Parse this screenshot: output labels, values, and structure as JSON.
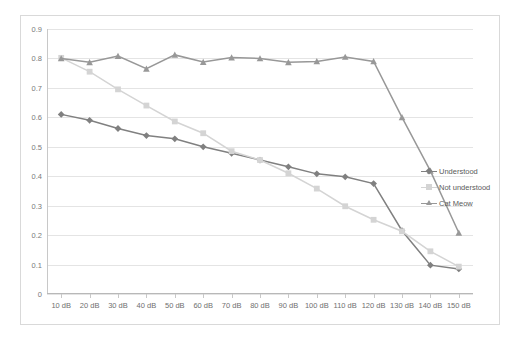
{
  "chart_data": {
    "type": "line",
    "title": "",
    "subtitle": "",
    "xlabel": "",
    "ylabel": "",
    "categories": [
      "10 dB",
      "20 dB",
      "30 dB",
      "40 dB",
      "50 dB",
      "60 dB",
      "70 dB",
      "80 dB",
      "90 dB",
      "100 dB",
      "110 dB",
      "120 dB",
      "130 dB",
      "140 dB",
      "150 dB"
    ],
    "ylim": [
      0,
      0.9
    ],
    "yticks": [
      "0",
      "0.1",
      "0.2",
      "0.3",
      "0.4",
      "0.5",
      "0.6",
      "0.7",
      "0.8",
      "0.9"
    ],
    "ytick_values": [
      0,
      0.1,
      0.2,
      0.3,
      0.4,
      0.5,
      0.6,
      0.7,
      0.8,
      0.9
    ],
    "grid": true,
    "legend_position": "right",
    "series": [
      {
        "name": "Understood",
        "color": "#808080",
        "marker": "diamond",
        "values": [
          0.61,
          0.59,
          0.562,
          0.538,
          0.527,
          0.5,
          0.478,
          0.455,
          0.432,
          0.408,
          0.398,
          0.375,
          0.215,
          0.098,
          0.085
        ]
      },
      {
        "name": "Not understood",
        "color": "#d4d4d4",
        "marker": "square",
        "values": [
          0.802,
          0.755,
          0.695,
          0.64,
          0.586,
          0.546,
          0.485,
          0.455,
          0.41,
          0.358,
          0.298,
          0.252,
          0.213,
          0.145,
          0.093
        ]
      },
      {
        "name": "Cat Meow",
        "color": "#989898",
        "marker": "triangle",
        "values": [
          0.8,
          0.787,
          0.808,
          0.765,
          0.812,
          0.788,
          0.803,
          0.8,
          0.787,
          0.79,
          0.805,
          0.79,
          0.6,
          0.418,
          0.208
        ]
      }
    ]
  },
  "legend": {
    "items": [
      {
        "label": "Understood"
      },
      {
        "label": "Not understood"
      },
      {
        "label": "Cat Meow"
      }
    ]
  },
  "colors": {
    "border": "#d9d9d9",
    "grid": "#e4e4e4",
    "axis": "#c8c8c8",
    "tick_text": "#7a7a7a",
    "background": "#ffffff"
  }
}
